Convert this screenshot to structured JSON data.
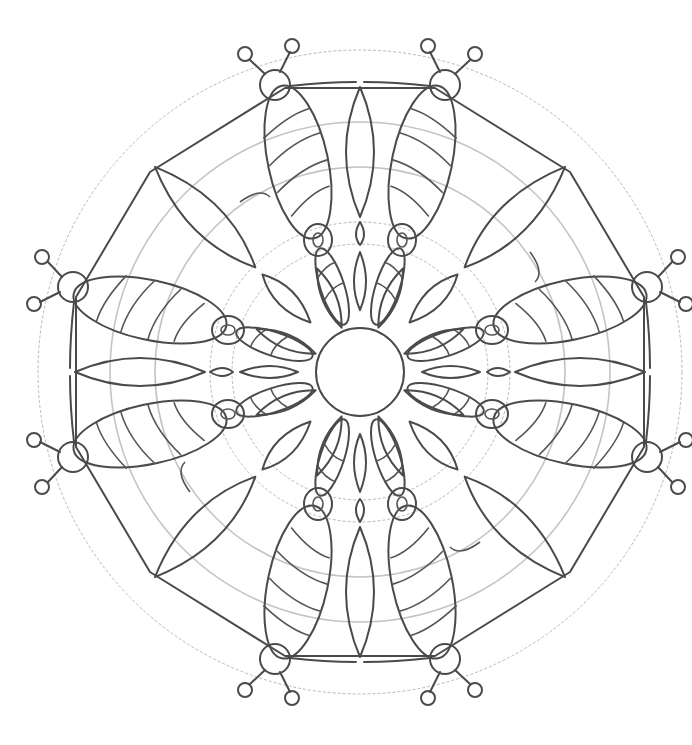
{
  "image": {
    "subject": "mandala coloring page",
    "style": "pencil line drawing",
    "colors": {
      "background": "#ffffff",
      "ink": "#4a4a4a",
      "guide": "#b8b8b8"
    }
  }
}
